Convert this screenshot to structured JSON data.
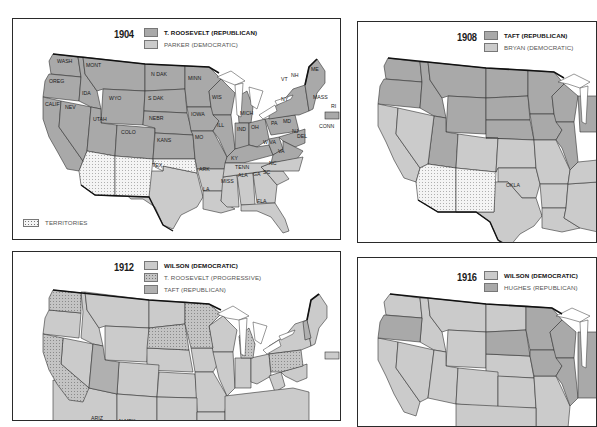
{
  "colors": {
    "republican_fill": "#a9a9a9",
    "democratic_fill": "#cbcbcb",
    "territory_fill": "#f4f4f4",
    "border": "#2a2a2a",
    "lakes": "#ffffff"
  },
  "panels": [
    {
      "year": "1904",
      "legend": [
        {
          "label": "T. ROOSEVELT (REPUBLICAN)",
          "fill": "republican",
          "bold": true
        },
        {
          "label": "PARKER (DEMOCRATIC)",
          "fill": "democratic",
          "bold": false
        }
      ],
      "extra_legend": {
        "label": "TERRITORIES",
        "fill": "territory"
      },
      "state_labels": [
        "WASH",
        "OREG",
        "CALIF",
        "NEV",
        "IDA",
        "MONT",
        "WYO",
        "UTAH",
        "COLO",
        "N DAK",
        "S DAK",
        "NEBR",
        "KANS",
        "MINN",
        "IOWA",
        "MO",
        "WIS",
        "ILL",
        "MICH",
        "IND",
        "OH",
        "KY",
        "TENN",
        "ARK",
        "TEX",
        "LA",
        "MISS",
        "ALA",
        "GA",
        "SC",
        "NC",
        "VA",
        "W VA",
        "PA",
        "MD",
        "DEL",
        "NJ",
        "NY",
        "VT",
        "NH",
        "ME",
        "MASS",
        "RI",
        "CONN",
        "FLA"
      ]
    },
    {
      "year": "1908",
      "legend": [
        {
          "label": "TAFT (REPUBLICAN)",
          "fill": "republican",
          "bold": true
        },
        {
          "label": "BRYAN (DEMOCRATIC)",
          "fill": "democratic",
          "bold": false
        }
      ],
      "state_labels": [
        "OKLA"
      ]
    },
    {
      "year": "1912",
      "legend": [
        {
          "label": "WILSON (DEMOCRATIC)",
          "fill": "democratic",
          "bold": true
        },
        {
          "label": "T. ROOSEVELT (PROGRESSIVE)",
          "fill": "progressive",
          "bold": false
        },
        {
          "label": "TAFT (REPUBLICAN)",
          "fill": "republican",
          "bold": false
        }
      ],
      "state_labels": [
        "ARIZ",
        "N MEX"
      ]
    },
    {
      "year": "1916",
      "legend": [
        {
          "label": "WILSON (DEMOCRATIC)",
          "fill": "democratic",
          "bold": true
        },
        {
          "label": "HUGHES (REPUBLICAN)",
          "fill": "republican",
          "bold": false
        }
      ],
      "state_labels": []
    }
  ]
}
